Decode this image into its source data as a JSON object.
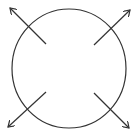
{
  "diagram": {
    "title": "",
    "stroke_color": "#333333",
    "background_color": "#ffffff",
    "circle": {
      "cx": 69,
      "cy": 68.5,
      "rx": 57,
      "ry": 59.5
    },
    "arrows": [
      {
        "name": "arrow-up-left",
        "x1": 46,
        "y1": 44,
        "x2": 10,
        "y2": 8
      },
      {
        "name": "arrow-up-right",
        "x1": 94,
        "y1": 45,
        "x2": 130,
        "y2": 10
      },
      {
        "name": "arrow-down-left",
        "x1": 46,
        "y1": 92,
        "x2": 8,
        "y2": 127
      },
      {
        "name": "arrow-down-right",
        "x1": 94,
        "y1": 93,
        "x2": 129,
        "y2": 128
      }
    ]
  }
}
